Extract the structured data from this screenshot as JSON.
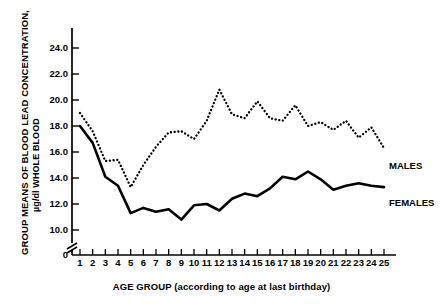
{
  "chart_data": {
    "type": "line",
    "title": "",
    "xlabel": "AGE GROUP (according to age at last birthday)",
    "ylabel": "GROUP MEANS OF BLOOD LEAD CONCENTRATION,",
    "ylabel_sub": "µg/dl WHOLE BLOOD",
    "x": [
      1,
      2,
      3,
      4,
      5,
      6,
      7,
      8,
      9,
      10,
      11,
      12,
      13,
      14,
      15,
      16,
      17,
      18,
      19,
      20,
      21,
      22,
      23,
      24,
      25
    ],
    "categories": [
      "1",
      "2",
      "3",
      "4",
      "5",
      "6",
      "7",
      "8",
      "9",
      "10",
      "11",
      "12",
      "13",
      "14",
      "15",
      "16",
      "17",
      "18",
      "19",
      "20",
      "21",
      "22",
      "23",
      "24",
      "25"
    ],
    "yticks": [
      24.0,
      22.0,
      20.0,
      18.0,
      16.0,
      14.0,
      12.0,
      10.0
    ],
    "ytick_labels": [
      "24.0",
      "22.0",
      "20.0",
      "18.0",
      "16.0",
      "14.0",
      "12.0",
      "10.0"
    ],
    "zero_tick_label": "0",
    "ylim": [
      10.0,
      25.2
    ],
    "axis_break": true,
    "grid": false,
    "legend_position": "right-inline",
    "series": [
      {
        "name": "MALES",
        "style": "dotted",
        "color": "#000000",
        "values": [
          19.0,
          17.6,
          15.3,
          15.4,
          13.3,
          15.0,
          16.4,
          17.5,
          17.6,
          17.0,
          18.4,
          20.8,
          18.9,
          18.6,
          19.9,
          18.6,
          18.4,
          19.6,
          18.0,
          18.3,
          17.7,
          18.4,
          17.1,
          17.9,
          16.3
        ]
      },
      {
        "name": "FEMALES",
        "style": "solid",
        "color": "#000000",
        "values": [
          18.0,
          16.7,
          14.1,
          13.4,
          11.3,
          11.7,
          11.4,
          11.6,
          10.8,
          11.9,
          12.0,
          11.5,
          12.4,
          12.8,
          12.6,
          13.2,
          14.1,
          13.9,
          14.5,
          13.9,
          13.1,
          13.4,
          13.6,
          13.4,
          13.3
        ]
      }
    ]
  },
  "labels": {
    "males": "MALES",
    "females": "FEMALES"
  }
}
